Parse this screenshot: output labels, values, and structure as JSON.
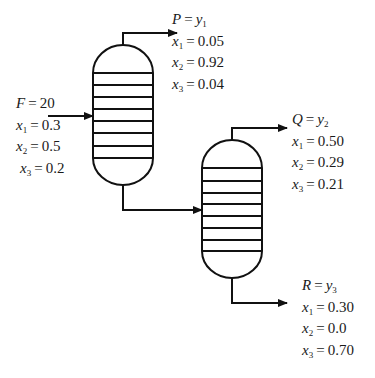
{
  "diagram": {
    "type": "two-column distillation flowsheet",
    "units": [
      {
        "id": "column-1",
        "trays": 8
      },
      {
        "id": "column-2",
        "trays": 8
      }
    ],
    "streams": [
      {
        "id": "feed",
        "name": "F",
        "value": "20",
        "to": "column-1",
        "compositions": [
          {
            "var": "x",
            "sub": "1",
            "value": "0.3"
          },
          {
            "var": "x",
            "sub": "2",
            "value": "0.5"
          },
          {
            "var": "x",
            "sub": "3",
            "value": "0.2"
          }
        ]
      },
      {
        "id": "product-p",
        "name": "P",
        "flow_var": "y",
        "flow_sub": "1",
        "from": "column-1 top",
        "compositions": [
          {
            "var": "x",
            "sub": "1",
            "value": "0.05"
          },
          {
            "var": "x",
            "sub": "2",
            "value": "0.92"
          },
          {
            "var": "x",
            "sub": "3",
            "value": "0.04"
          }
        ]
      },
      {
        "id": "product-q",
        "name": "Q",
        "flow_var": "y",
        "flow_sub": "2",
        "from": "column-2 top",
        "compositions": [
          {
            "var": "x",
            "sub": "1",
            "value": "0.50"
          },
          {
            "var": "x",
            "sub": "2",
            "value": "0.29"
          },
          {
            "var": "x",
            "sub": "3",
            "value": "0.21"
          }
        ]
      },
      {
        "id": "product-r",
        "name": "R",
        "flow_var": "y",
        "flow_sub": "3",
        "from": "column-2 bottom",
        "compositions": [
          {
            "var": "x",
            "sub": "1",
            "value": "0.30"
          },
          {
            "var": "x",
            "sub": "2",
            "value": "0.0"
          },
          {
            "var": "x",
            "sub": "3",
            "value": "0.70"
          }
        ]
      }
    ],
    "connection": {
      "from": "column-1 bottom",
      "to": "column-2 side feed"
    }
  },
  "labels": {
    "eq": "=",
    "feed": {
      "name": "F",
      "value": "20",
      "x1": {
        "v": "x",
        "s": "1",
        "val": "0.3"
      },
      "x2": {
        "v": "x",
        "s": "2",
        "val": "0.5"
      },
      "x3": {
        "v": "x",
        "s": "3",
        "val": "0.2"
      }
    },
    "p": {
      "name": "P",
      "fv": "y",
      "fs": "1",
      "x1": {
        "v": "x",
        "s": "1",
        "val": "0.05"
      },
      "x2": {
        "v": "x",
        "s": "2",
        "val": "0.92"
      },
      "x3": {
        "v": "x",
        "s": "3",
        "val": "0.04"
      }
    },
    "q": {
      "name": "Q",
      "fv": "y",
      "fs": "2",
      "x1": {
        "v": "x",
        "s": "1",
        "val": "0.50"
      },
      "x2": {
        "v": "x",
        "s": "2",
        "val": "0.29"
      },
      "x3": {
        "v": "x",
        "s": "3",
        "val": "0.21"
      }
    },
    "r": {
      "name": "R",
      "fv": "y",
      "fs": "3",
      "x1": {
        "v": "x",
        "s": "1",
        "val": "0.30"
      },
      "x2": {
        "v": "x",
        "s": "2",
        "val": "0.0"
      },
      "x3": {
        "v": "x",
        "s": "3",
        "val": "0.70"
      }
    }
  },
  "colors": {
    "stroke": "#111111",
    "background": "#ffffff",
    "text": "#1a1a1a"
  }
}
